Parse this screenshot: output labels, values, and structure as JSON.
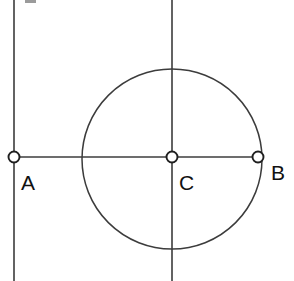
{
  "figure": {
    "width": 294,
    "height": 281,
    "background_color": "#ffffff",
    "stroke_color": "#3c3c3c",
    "label_color": "#111111",
    "marker_fill": "#ffffff",
    "marker_stroke": "#1f1f1f"
  },
  "geometry": {
    "circle": {
      "name": "main-circle",
      "cx": 172,
      "cy": 159,
      "r": 90
    },
    "lines": [
      {
        "name": "tangent-vertical-line",
        "x1": 14,
        "y1": 0,
        "x2": 14,
        "y2": 281
      },
      {
        "name": "vertical-diameter-line",
        "x1": 172,
        "y1": 0,
        "x2": 172,
        "y2": 281
      },
      {
        "name": "horizontal-segment-ab",
        "x1": 14,
        "y1": 157,
        "x2": 258,
        "y2": 157
      }
    ]
  },
  "points": [
    {
      "id": "A",
      "name": "point-a",
      "label": "A",
      "cx": 14,
      "cy": 157,
      "r": 5.5,
      "label_x": 21,
      "label_y": 190
    },
    {
      "id": "C",
      "name": "point-c",
      "label": "C",
      "cx": 172,
      "cy": 157,
      "r": 5.5,
      "label_x": 179,
      "label_y": 190
    },
    {
      "id": "B",
      "name": "point-b",
      "label": "B",
      "cx": 258,
      "cy": 157,
      "r": 5.5,
      "label_x": 271,
      "label_y": 180
    }
  ],
  "artifact": {
    "name": "top-crop-artifact",
    "x": 25,
    "y": 0,
    "width": 11,
    "height": 3
  }
}
